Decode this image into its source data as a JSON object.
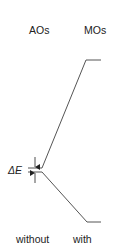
{
  "diagram": {
    "column_headers": {
      "left": "AOs",
      "right": "MOs"
    },
    "footer_labels": {
      "left": "without",
      "right": "with"
    },
    "energy_gap_label": "ΔE",
    "line_color": "#555555",
    "levels": {
      "ao_upper": {
        "x1": 28,
        "x2": 42,
        "y": 168
      },
      "ao_lower": {
        "x1": 28,
        "x2": 42,
        "y": 172
      },
      "mo_upper": {
        "x1": 86,
        "x2": 101,
        "y": 60
      },
      "mo_lower": {
        "x1": 87,
        "x2": 101,
        "y": 222
      }
    }
  }
}
